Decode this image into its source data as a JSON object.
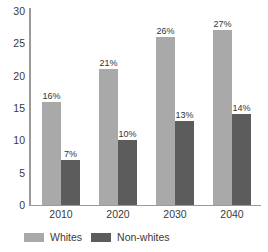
{
  "chart_data": {
    "type": "bar",
    "title": "",
    "subtitle": "",
    "xlabel": "",
    "ylabel": "",
    "categories": [
      "2010",
      "2020",
      "2030",
      "2040"
    ],
    "series": [
      {
        "name": "Whites",
        "color": "#a9a9a9",
        "values": [
          16,
          21,
          26,
          27
        ],
        "labels": [
          "16%",
          "21%",
          "26%",
          "27%"
        ]
      },
      {
        "name": "Non-whites",
        "color": "#5c5c5c",
        "values": [
          7,
          10,
          13,
          14
        ],
        "labels": [
          "7%",
          "10%",
          "13%",
          "14%"
        ]
      }
    ],
    "ylim": [
      0,
      30
    ],
    "yticks": [
      0,
      5,
      10,
      15,
      20,
      25,
      30
    ],
    "ytick_labels": [
      "0",
      "5",
      "10",
      "15",
      "20",
      "25",
      "30"
    ],
    "grid": false,
    "legend_position": "bottom-left",
    "axis_color": "#9a9a9a",
    "text_color": "#3a3a3a",
    "background": "#ffffff"
  },
  "legend": {
    "items": [
      {
        "label": "Whites",
        "color": "#a9a9a9"
      },
      {
        "label": "Non-whites",
        "color": "#5c5c5c"
      }
    ]
  }
}
